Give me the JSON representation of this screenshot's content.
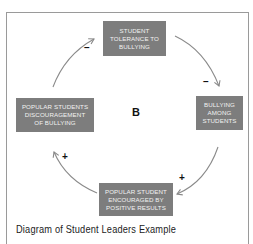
{
  "diagram": {
    "loop_label": "B",
    "nodes": {
      "top": [
        "STUDENT",
        "TOLERANCE TO",
        "BULLYING"
      ],
      "right": [
        "BULLYING",
        "AMONG",
        "STUDENTS"
      ],
      "bottom": [
        "POPULAR STUDENT",
        "ENCOURAGED BY",
        "POSITIVE RESULTS"
      ],
      "left": [
        "POPULAR STUDENTS",
        "DISCOURAGEMENT",
        "OF BULLYING"
      ]
    },
    "links": [
      {
        "from": "top",
        "to": "right",
        "polarity": "–"
      },
      {
        "from": "right",
        "to": "bottom",
        "polarity": "+"
      },
      {
        "from": "bottom",
        "to": "left",
        "polarity": "+"
      },
      {
        "from": "left",
        "to": "top",
        "polarity": "–"
      }
    ],
    "colors": {
      "node_fill": "#7d7d7d",
      "node_text": "#f2f2f2",
      "arrow": "#888888"
    }
  },
  "caption": "Diagram of Student Leaders Example"
}
